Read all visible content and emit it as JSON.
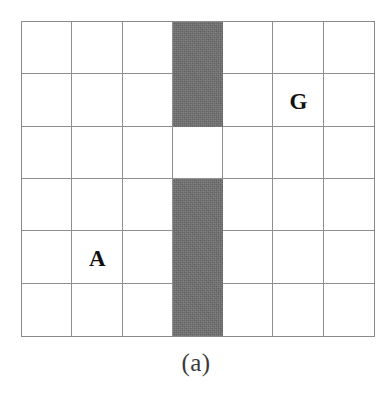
{
  "figure": {
    "caption": "(a)",
    "type": "gridworld-diagram",
    "title": ""
  },
  "grid": {
    "columns": 7,
    "rows": 6,
    "line_color": "#8f8f8f",
    "border_color": "#8a8a8a",
    "cell_color": "#ffffff",
    "background_color": "#ffffff"
  },
  "walls": {
    "fill_color": "#6d6d6d",
    "description": "vertical wall in column 4 with a single opening",
    "cells": [
      {
        "row": 0,
        "col": 3
      },
      {
        "row": 1,
        "col": 3
      },
      {
        "row": 3,
        "col": 3
      },
      {
        "row": 4,
        "col": 3
      },
      {
        "row": 5,
        "col": 3
      }
    ],
    "opening": {
      "row": 2,
      "col": 3
    }
  },
  "labels": [
    {
      "text": "A",
      "row": 4,
      "col": 1,
      "name": "agent-start-label"
    },
    {
      "text": "G",
      "row": 1,
      "col": 5,
      "name": "goal-label"
    }
  ]
}
